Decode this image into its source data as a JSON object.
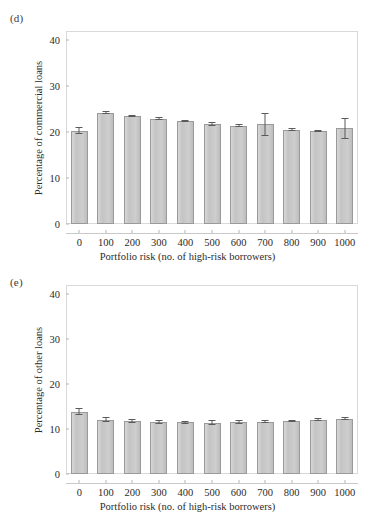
{
  "figure": {
    "background": "#ffffff",
    "bar_fill": "#c9c9c9",
    "bar_stroke": "#9a9a9a",
    "frame_color": "#d9d9d9"
  },
  "chart_data": [
    {
      "type": "bar",
      "panel_label": "(d)",
      "title": "",
      "xlabel": "Portfolio risk (no. of high-risk borrowers)",
      "ylabel": "Percentage of commercial loans",
      "categories": [
        "0",
        "100",
        "200",
        "300",
        "400",
        "500",
        "600",
        "700",
        "800",
        "900",
        "1000"
      ],
      "values": [
        20.3,
        24.2,
        23.5,
        22.9,
        22.4,
        21.8,
        21.4,
        21.7,
        20.5,
        20.2,
        20.8
      ],
      "errors": [
        0.8,
        0.3,
        0.3,
        0.3,
        0.3,
        0.5,
        0.3,
        2.5,
        0.3,
        0.2,
        2.3
      ],
      "ylim": [
        0,
        42
      ],
      "yticks": [
        0,
        10,
        20,
        30,
        40
      ],
      "ytick_labels": [
        "0",
        "10",
        "20",
        "30",
        "40"
      ],
      "grid": false,
      "legend": "none"
    },
    {
      "type": "bar",
      "panel_label": "(e)",
      "title": "",
      "xlabel": "Portfolio risk (no. of high-risk borrowers)",
      "ylabel": "Percentage of other loans",
      "categories": [
        "0",
        "100",
        "200",
        "300",
        "400",
        "500",
        "600",
        "700",
        "800",
        "900",
        "1000"
      ],
      "values": [
        13.8,
        12.1,
        11.8,
        11.5,
        11.5,
        11.4,
        11.5,
        11.6,
        11.8,
        12.1,
        12.3
      ],
      "errors": [
        0.8,
        0.5,
        0.4,
        0.4,
        0.3,
        0.6,
        0.4,
        0.3,
        0.3,
        0.4,
        0.4
      ],
      "ylim": [
        0,
        42
      ],
      "yticks": [
        0,
        10,
        20,
        30,
        40
      ],
      "ytick_labels": [
        "0",
        "10",
        "20",
        "30",
        "40"
      ],
      "grid": false,
      "legend": "none"
    }
  ]
}
